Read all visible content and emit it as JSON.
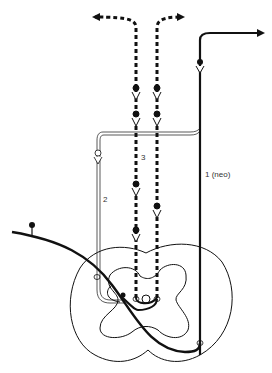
{
  "diagram": {
    "type": "spinal-cord ascending pathways schematic",
    "labels": {
      "pathway_1": "1 (neo)",
      "pathway_2": "2",
      "pathway_3": "3"
    },
    "colors": {
      "ink": "#111111",
      "background": "#ffffff"
    },
    "elements": [
      "dashed bilateral ascending tracts with arrowheads",
      "neospinothalamic solid tract",
      "double-line tract 2",
      "primary afferent fiber with cell body",
      "spinal cord cross-section outline",
      "grey matter butterfly outline"
    ]
  }
}
